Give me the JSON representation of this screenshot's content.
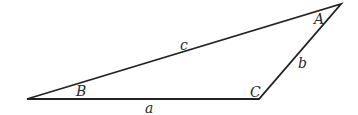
{
  "diagram": {
    "type": "triangle",
    "stroke_color": "#222222",
    "vertices": {
      "B": {
        "label": "B",
        "x": 27,
        "y": 99
      },
      "C": {
        "label": "C",
        "x": 259,
        "y": 99
      },
      "A": {
        "label": "A",
        "x": 341,
        "y": 4
      }
    },
    "angle_labels": [
      {
        "id": "A",
        "text": "A",
        "x": 314,
        "y": 24
      },
      {
        "id": "B",
        "text": "B",
        "x": 76,
        "y": 96
      },
      {
        "id": "C",
        "text": "C",
        "x": 250,
        "y": 97
      }
    ],
    "side_labels": [
      {
        "id": "a",
        "text": "a",
        "x": 145,
        "y": 113,
        "between": [
          "B",
          "C"
        ]
      },
      {
        "id": "b",
        "text": "b",
        "x": 298,
        "y": 68,
        "between": [
          "C",
          "A"
        ]
      },
      {
        "id": "c",
        "text": "c",
        "x": 180,
        "y": 50,
        "between": [
          "B",
          "A"
        ]
      }
    ]
  }
}
